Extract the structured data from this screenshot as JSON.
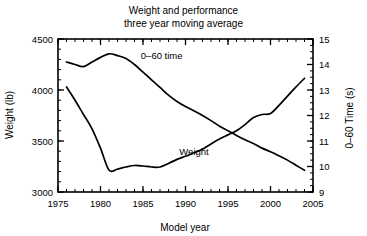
{
  "chart_data": {
    "type": "line",
    "title": "Weight and performance",
    "subtitle": "three year moving average",
    "xlabel": "Model year",
    "ylabel": "Weight (lb)",
    "y2label": "0–60 Time (s)",
    "grid": false,
    "legend_position": "inline-labels",
    "xlim": [
      1975,
      2005
    ],
    "ylim": [
      3000,
      4500
    ],
    "y2lim": [
      9,
      15
    ],
    "xticks": [
      1975,
      1980,
      1985,
      1990,
      1995,
      2000,
      2005
    ],
    "xtick_labels": [
      "1975",
      "1980",
      "1985",
      "1990",
      "1995",
      "2000",
      "2005"
    ],
    "x_minor_step": 1,
    "yticks": [
      3000,
      3500,
      4000,
      4500
    ],
    "ytick_labels": [
      "3000",
      "3500",
      "4000",
      "4500"
    ],
    "y_minor_step": 100,
    "y2ticks": [
      9,
      10,
      11,
      12,
      13,
      14,
      15
    ],
    "y2tick_labels": [
      "9",
      "10",
      "11",
      "12",
      "13",
      "14",
      "15"
    ],
    "y2_minor_step": 0.25,
    "x": [
      1976,
      1977,
      1978,
      1979,
      1980,
      1981,
      1982,
      1983,
      1984,
      1985,
      1986,
      1987,
      1988,
      1989,
      1990,
      1991,
      1992,
      1993,
      1994,
      1995,
      1996,
      1997,
      1998,
      1999,
      2000,
      2001,
      2002,
      2003,
      2004
    ],
    "series": [
      {
        "name": "Weight",
        "axis": "left",
        "units": "lb",
        "label": "Weight",
        "label_x": 1991.0,
        "label_y": 3360,
        "values": [
          4030,
          3900,
          3760,
          3620,
          3430,
          3215,
          3225,
          3245,
          3260,
          3255,
          3245,
          3245,
          3280,
          3320,
          3350,
          3385,
          3420,
          3470,
          3520,
          3560,
          3600,
          3660,
          3730,
          3760,
          3770,
          3850,
          3940,
          4030,
          4115
        ]
      },
      {
        "name": "0–60 time",
        "axis": "right",
        "units": "s",
        "label": "0–60 time",
        "label_x": 1987.2,
        "label_y": 14.22,
        "values": [
          14.1,
          14.0,
          13.92,
          14.1,
          14.28,
          14.42,
          14.35,
          14.24,
          14.0,
          13.7,
          13.4,
          13.1,
          12.8,
          12.55,
          12.35,
          12.18,
          12.0,
          11.8,
          11.58,
          11.4,
          11.22,
          11.05,
          10.9,
          10.72,
          10.58,
          10.42,
          10.25,
          10.05,
          9.85
        ]
      }
    ]
  },
  "annotations": {
    "title_line1": "Weight and performance",
    "title_line2": "three year moving average"
  }
}
